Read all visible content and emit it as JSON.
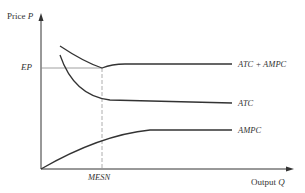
{
  "axes": {
    "y_label_text": "Price",
    "y_label_symbol": "P",
    "x_label_text": "Output",
    "x_label_symbol": "Q"
  },
  "markers": {
    "price_level": "EP",
    "output_level": "MESN"
  },
  "curves": [
    {
      "name": "ATC + AMPC",
      "shape": "U-shaped, minimum at MESN, then flat at EP"
    },
    {
      "name": "ATC",
      "shape": "declining, flattening after MESN"
    },
    {
      "name": "AMPC",
      "shape": "rising from origin, flattening after MESN"
    }
  ],
  "labels": {
    "atc_ampc": "ATC + AMPC",
    "atc": "ATC",
    "ampc": "AMPC"
  },
  "colors": {
    "line": "#333333",
    "guide": "#999999"
  }
}
